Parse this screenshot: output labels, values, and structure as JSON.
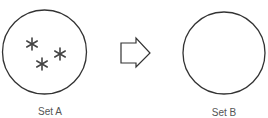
{
  "diagram": {
    "sets": [
      {
        "name": "Set A",
        "members": [
          "*",
          "*",
          "*"
        ]
      },
      {
        "name": "Set B",
        "members": []
      }
    ],
    "arrow": {
      "direction": "right"
    },
    "colors": {
      "stroke": "#333333",
      "text": "#555555",
      "star": "#444444"
    }
  }
}
